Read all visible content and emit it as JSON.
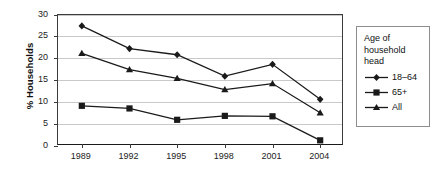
{
  "chart_data": {
    "type": "line",
    "title": "",
    "xlabel": "",
    "ylabel": "% Households",
    "categories": [
      "1989",
      "1992",
      "1995",
      "1998",
      "2001",
      "2004"
    ],
    "ylim": [
      0,
      30
    ],
    "yticks": [
      "0",
      "5",
      "10",
      "15",
      "20",
      "25",
      "30"
    ],
    "grid": true,
    "legend_position": "right",
    "legend_title": "Age of household head",
    "legend_title_lines": [
      "Age of",
      "household",
      "head"
    ],
    "series": [
      {
        "name": "18–64",
        "marker": "diamond",
        "values": [
          27.5,
          22.3,
          20.9,
          16.0,
          18.7,
          10.7
        ]
      },
      {
        "name": "65+",
        "marker": "square",
        "values": [
          9.2,
          8.6,
          6.0,
          6.9,
          6.8,
          1.3
        ]
      },
      {
        "name": "All",
        "marker": "triangle",
        "values": [
          21.2,
          17.5,
          15.5,
          12.9,
          14.3,
          7.6
        ]
      }
    ],
    "colors": {
      "line": "#1a1a1a",
      "marker": "#1a1a1a",
      "grid": "#c9c9c9",
      "axis": "#3b3b3b",
      "legend_border": "#8d8d8d",
      "background": "#ffffff"
    }
  }
}
